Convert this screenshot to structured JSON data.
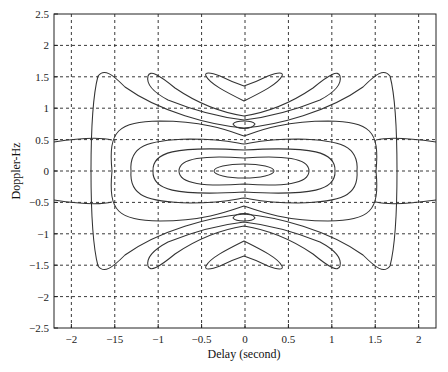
{
  "chart_data": {
    "type": "contour",
    "title": "",
    "xlabel": "Delay (second)",
    "ylabel": "Doppler-Hz",
    "xlim": [
      -2.2,
      2.2
    ],
    "ylim": [
      -2.5,
      2.5
    ],
    "grid": true,
    "x_ticks": [
      -2,
      -1.5,
      -1,
      -0.5,
      0,
      0.5,
      1,
      1.5,
      2
    ],
    "x_tick_labels": [
      "-2",
      "-15",
      "-1",
      "-0.5",
      "0",
      "0.5",
      "1",
      "1.5",
      "2"
    ],
    "y_ticks": [
      2.5,
      2,
      1.5,
      1,
      0.5,
      0,
      -0.5,
      -1,
      -1.5,
      -2,
      -2.5
    ],
    "y_tick_labels": [
      "2.5",
      "2",
      "1.5",
      "1",
      "0.5",
      "0",
      "-0.5",
      "-1",
      "-1.5",
      "-2",
      "-2.5"
    ],
    "contours": [
      {
        "level": "inner-1",
        "x_extent": [
          -0.35,
          0.35
        ],
        "y_extent": [
          -0.1,
          0.1
        ]
      },
      {
        "level": "inner-2",
        "x_extent": [
          -0.75,
          0.75
        ],
        "y_extent": [
          -0.2,
          0.2
        ]
      },
      {
        "level": "inner-3",
        "x_extent": [
          -1.05,
          1.05
        ],
        "y_extent": [
          -0.33,
          0.33
        ]
      },
      {
        "level": "inner-4",
        "x_extent": [
          -1.3,
          1.3
        ],
        "y_extent": [
          -0.5,
          0.5
        ]
      },
      {
        "level": "inner-5",
        "x_extent": [
          -1.5,
          1.5
        ],
        "y_extent": [
          -0.75,
          0.75
        ]
      },
      {
        "level": "outer-bowtie",
        "x_extent": [
          -1.75,
          1.75
        ],
        "y_extent": [
          -1.6,
          1.6
        ]
      },
      {
        "level": "sidelobe-lens",
        "centers": [
          [
            0,
            0.7
          ],
          [
            0,
            -0.7
          ]
        ],
        "x_extent": [
          -0.12,
          0.12
        ]
      },
      {
        "level": "sidelobe-chevron",
        "centers": [
          [
            0,
            1.45
          ],
          [
            0,
            -1.45
          ]
        ],
        "x_extent": [
          -0.5,
          0.5
        ]
      },
      {
        "level": "sidelobe-wing",
        "x_extent": [
          -1.1,
          1.1
        ],
        "y_extent": [
          -1.55,
          1.55
        ]
      }
    ]
  }
}
